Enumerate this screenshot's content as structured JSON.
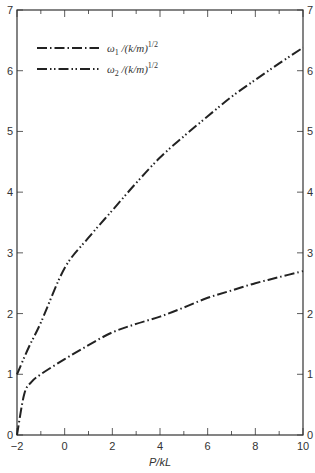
{
  "chart_data": {
    "type": "line",
    "title": "",
    "xlabel": "P/kL",
    "ylabel": "",
    "xlim": [
      -2,
      10
    ],
    "ylim": [
      0,
      7
    ],
    "grid": false,
    "legend_position": "upper-left",
    "x_ticks": [
      -2,
      0,
      2,
      4,
      6,
      8,
      10
    ],
    "x_minor_ticks": [
      -1,
      1,
      3,
      5,
      7,
      9
    ],
    "y_ticks": [
      0,
      1,
      2,
      3,
      4,
      5,
      6,
      7
    ],
    "y_ticks_right": [
      0,
      1,
      2,
      3,
      4,
      5,
      6,
      7
    ],
    "series": [
      {
        "name": "ω1/(k/m)^1/2",
        "label_main": "ω",
        "label_sub": "1",
        "label_rest": "/(k/m)",
        "label_sup": "1/2",
        "line_style": "dash-dot",
        "x": [
          -2,
          -1.7,
          -1.4,
          -1,
          0,
          1,
          2,
          3,
          4,
          5,
          6,
          7,
          8,
          9,
          10
        ],
        "values": [
          0,
          0.67,
          0.87,
          1.0,
          1.25,
          1.48,
          1.69,
          1.83,
          1.95,
          2.1,
          2.26,
          2.38,
          2.5,
          2.6,
          2.7
        ]
      },
      {
        "name": "ω2/(k/m)^1/2",
        "label_main": "ω",
        "label_sub": "2",
        "label_rest": "/(k/m)",
        "label_sup": "1/2",
        "line_style": "dash-dot-dot",
        "x": [
          -2,
          -1.5,
          -1,
          0,
          1,
          2,
          3,
          4,
          5,
          6,
          7,
          8,
          9,
          10
        ],
        "values": [
          1.0,
          1.45,
          1.85,
          2.75,
          3.25,
          3.7,
          4.15,
          4.57,
          4.92,
          5.25,
          5.57,
          5.85,
          6.12,
          6.38
        ]
      }
    ]
  }
}
